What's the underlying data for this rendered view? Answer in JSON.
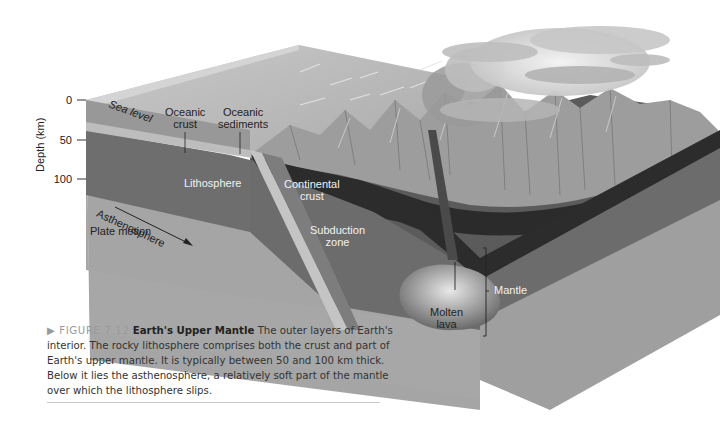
{
  "figure": {
    "number_label": "▶ FIGURE 7.12",
    "title": "Earth's Upper Mantle",
    "caption": "The outer layers of Earth's interior. The rocky lithosphere comprises both the crust and part of Earth's upper mantle. It is typically between 50 and 100 km thick. Below it lies the asthenosphere, a relatively soft part of the mantle over which the lithosphere slips."
  },
  "axis": {
    "title": "Depth (km)",
    "ticks": [
      "0",
      "50",
      "100"
    ]
  },
  "labels": {
    "sea_level": "Sea level",
    "oceanic_crust": [
      "Oceanic",
      "crust"
    ],
    "oceanic_sediments": [
      "Oceanic",
      "sediments"
    ],
    "lithosphere": "Lithosphere",
    "asthenosphere": "Asthenosphere",
    "plate_motion": "Plate motion",
    "continental_crust": [
      "Continental",
      "crust"
    ],
    "subduction_zone": [
      "Subduction",
      "zone"
    ],
    "molten_lava": [
      "Molten",
      "lava"
    ],
    "mantle": "Mantle"
  },
  "colors": {
    "ocean_surface": "#b9b9b9",
    "lithosphere": "#6f6f6f",
    "asthenosphere": "#a5a5a5",
    "continental_crust": "#2f2f2f",
    "mountains": "#9a9a9a",
    "magma": "#7a7a7a"
  }
}
